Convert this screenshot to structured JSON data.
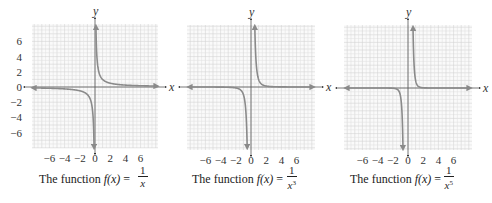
{
  "chart_data": [
    {
      "type": "line",
      "title": "The function f(x) = 1/x",
      "function": "1/x",
      "xlabel": "x",
      "ylabel": "y",
      "xlim": [
        -8,
        8
      ],
      "ylim": [
        -8,
        8
      ],
      "x_ticks": [
        "-6",
        "-4",
        "-2",
        "0",
        "2",
        "4",
        "6"
      ],
      "y_ticks": [
        "6",
        "4",
        "2",
        "0",
        "-2",
        "-4",
        "-6"
      ],
      "grid": true,
      "series": [
        {
          "name": "right branch",
          "x": [
            0.125,
            0.25,
            0.5,
            1,
            2,
            4,
            8
          ],
          "y": [
            8,
            4,
            2,
            1,
            0.5,
            0.25,
            0.125
          ]
        },
        {
          "name": "left branch",
          "x": [
            -8,
            -4,
            -2,
            -1,
            -0.5,
            -0.25,
            -0.125
          ],
          "y": [
            -0.125,
            -0.25,
            -0.5,
            -1,
            -2,
            -4,
            -8
          ]
        }
      ]
    },
    {
      "type": "line",
      "title": "The function f(x) = 1/x^3",
      "function": "1/x^3",
      "xlabel": "x",
      "ylabel": "y",
      "xlim": [
        -8,
        8
      ],
      "ylim": [
        -8,
        8
      ],
      "x_ticks": [
        "-6",
        "-4",
        "-2",
        "0",
        "2",
        "4",
        "6"
      ],
      "grid": true,
      "series": [
        {
          "name": "right branch",
          "x": [
            0.5,
            0.75,
            1,
            1.5,
            2,
            4,
            8
          ],
          "y": [
            8,
            2.37,
            1,
            0.296,
            0.125,
            0.016,
            0.002
          ]
        },
        {
          "name": "left branch",
          "x": [
            -8,
            -4,
            -2,
            -1.5,
            -1,
            -0.75,
            -0.5
          ],
          "y": [
            -0.002,
            -0.016,
            -0.125,
            -0.296,
            -1,
            -2.37,
            -8
          ]
        }
      ]
    },
    {
      "type": "line",
      "title": "The function f(x) = 1/x^5",
      "function": "1/x^5",
      "xlabel": "x",
      "ylabel": "y",
      "xlim": [
        -8,
        8
      ],
      "ylim": [
        -8,
        8
      ],
      "x_ticks": [
        "-6",
        "-4",
        "-2",
        "0",
        "2",
        "4",
        "6"
      ],
      "grid": true,
      "series": [
        {
          "name": "right branch",
          "x": [
            0.66,
            0.8,
            1,
            1.25,
            1.5,
            2,
            8
          ],
          "y": [
            8,
            3.05,
            1,
            0.33,
            0.13,
            0.031,
            3e-05
          ]
        },
        {
          "name": "left branch",
          "x": [
            -8,
            -2,
            -1.5,
            -1.25,
            -1,
            -0.8,
            -0.66
          ],
          "y": [
            -3e-05,
            -0.031,
            -0.13,
            -0.33,
            -1,
            -3.05,
            -8
          ]
        }
      ]
    }
  ],
  "panels": [
    {
      "caption_prefix": "The function ",
      "caption_fx": "f(x)",
      "caption_eq": " = ",
      "numerator": "1",
      "denominator": "x",
      "exponent": "",
      "x_label": "x",
      "y_label": "y"
    },
    {
      "caption_prefix": "The function ",
      "caption_fx": "f(x)",
      "caption_eq": " = ",
      "numerator": "1",
      "denominator": "x",
      "exponent": "3",
      "x_label": "x",
      "y_label": "y"
    },
    {
      "caption_prefix": "The function ",
      "caption_fx": "f(x)",
      "caption_eq": " = ",
      "numerator": "1",
      "denominator": "x",
      "exponent": "5",
      "x_label": "x",
      "y_label": "y"
    }
  ],
  "colors": {
    "curve": "#8a8a8a",
    "axis": "#555555",
    "grid": "#e2e2e2",
    "grid_major": "#d4d4d4"
  }
}
